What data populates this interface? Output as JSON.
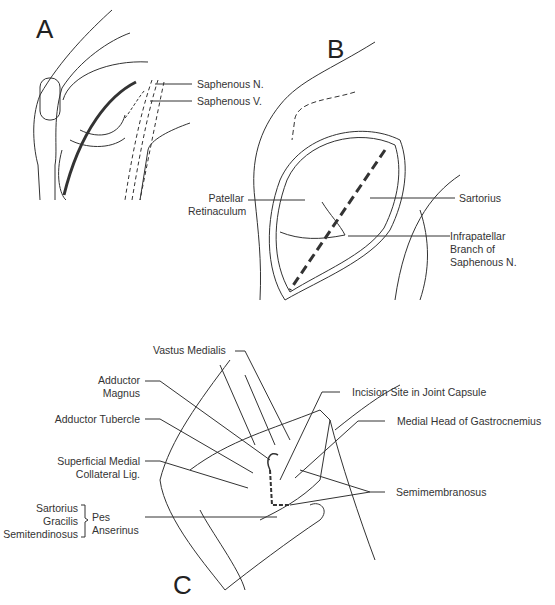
{
  "figure": {
    "panels": [
      {
        "id": "A",
        "letter": "A",
        "labels": {
          "saphenous_n": "Saphenous N.",
          "saphenous_v": "Saphenous V."
        }
      },
      {
        "id": "B",
        "letter": "B",
        "labels": {
          "patellar_1": "Patellar",
          "patellar_2": "Retinaculum",
          "sartorius": "Sartorius",
          "infra_1": "Infrapatellar",
          "infra_2": "Branch of",
          "infra_3": "Saphenous N."
        }
      },
      {
        "id": "C",
        "letter": "C",
        "labels": {
          "vastus": "Vastus Medialis",
          "add_mag_1": "Adductor",
          "add_mag_2": "Magnus",
          "add_tub": "Adductor Tubercle",
          "smcl_1": "Superficial Medial",
          "smcl_2": "Collateral Lig.",
          "sartorius": "Sartorius",
          "gracilis": "Gracilis",
          "semitend": "Semitendinosus",
          "pes_1": "Pes",
          "pes_2": "Anserinus",
          "incision": "Incision Site in Joint Capsule",
          "gastroc": "Medial Head of Gastrocnemius",
          "semimem": "Semimembranosus"
        }
      }
    ],
    "colors": {
      "ink": "#2a2a2a",
      "background": "#ffffff"
    }
  }
}
